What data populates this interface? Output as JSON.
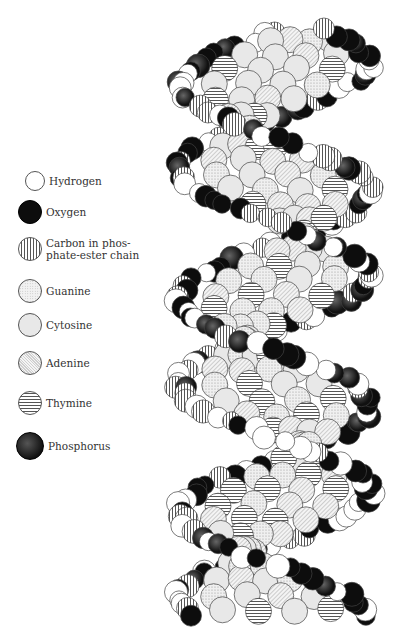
{
  "legend": {
    "items": [
      {
        "key": "hydrogen",
        "label": "Hydrogen",
        "swatch_color": "#ffffff",
        "pattern": "plain-white"
      },
      {
        "key": "oxygen",
        "label": "Oxygen",
        "swatch_color": "#0d0d0d",
        "pattern": "solid-black"
      },
      {
        "key": "carbon",
        "label": "Carbon in phos-\nphate-ester chain",
        "swatch_color": "#555555",
        "pattern": "vertical-stripes"
      },
      {
        "key": "guanine",
        "label": "Guanine",
        "swatch_color": "#bbbbbb",
        "pattern": "stipple"
      },
      {
        "key": "cytosine",
        "label": "Cytosine",
        "swatch_color": "#e8e8e8",
        "pattern": "light-gray"
      },
      {
        "key": "adenine",
        "label": "Adenine",
        "swatch_color": "#cfcfcf",
        "pattern": "fine-hatch"
      },
      {
        "key": "thymine",
        "label": "Thymine",
        "swatch_color": "#555555",
        "pattern": "horizontal-stripes"
      },
      {
        "key": "phosphorus",
        "label": "Phosphorus",
        "swatch_color": "#222222",
        "pattern": "dark-shaded"
      }
    ]
  }
}
